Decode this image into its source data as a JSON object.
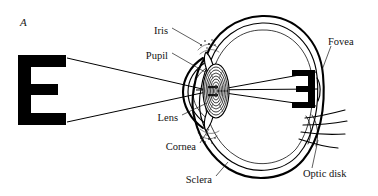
{
  "figure": {
    "panel_letter": "A",
    "background_color": "#ffffff",
    "ink_color": "#000000"
  },
  "stimulus": {
    "letter": "E",
    "orientation": "upright",
    "description": "large black letter E viewed by the eye"
  },
  "retinal_image": {
    "letter": "E",
    "orientation": "inverted",
    "description": "small reversed letter E projected on the retina"
  },
  "light_rays": {
    "count": 2,
    "color": "#000000",
    "description": "two rays from top and bottom of the E crossing at the lens"
  },
  "labels": [
    {
      "id": "iris",
      "text": "Iris",
      "x": 168,
      "y": 31,
      "anchor": "end"
    },
    {
      "id": "pupil",
      "text": "Pupil",
      "x": 168,
      "y": 56,
      "anchor": "end"
    },
    {
      "id": "fovea",
      "text": "Fovea",
      "x": 328,
      "y": 42,
      "anchor": "start"
    },
    {
      "id": "lens",
      "text": "Lens",
      "x": 178,
      "y": 118,
      "anchor": "end"
    },
    {
      "id": "cornea",
      "text": "Cornea",
      "x": 196,
      "y": 147,
      "anchor": "end"
    },
    {
      "id": "sclera",
      "text": "Sclera",
      "x": 212,
      "y": 180,
      "anchor": "end"
    },
    {
      "id": "optic-disk",
      "text": "Optic disk",
      "x": 303,
      "y": 174,
      "anchor": "start"
    }
  ],
  "structures": [
    "sclera",
    "cornea",
    "iris",
    "pupil",
    "lens",
    "retina",
    "fovea",
    "optic disk",
    "optic nerve"
  ]
}
